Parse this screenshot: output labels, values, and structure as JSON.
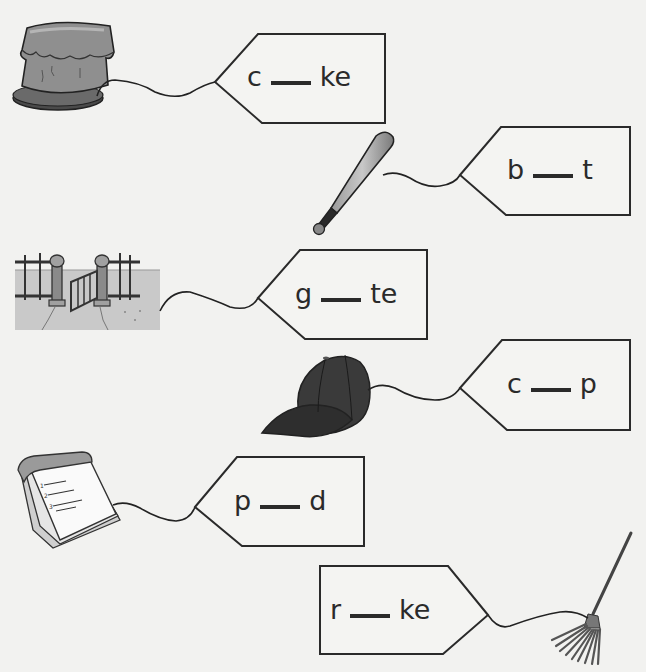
{
  "worksheet": {
    "items": [
      {
        "picture": "cake",
        "prefix": "c",
        "blank": "___",
        "suffix": "ke"
      },
      {
        "picture": "baseball-bat",
        "prefix": "b",
        "blank": "___",
        "suffix": "t"
      },
      {
        "picture": "gate",
        "prefix": "g",
        "blank": "___",
        "suffix": "te"
      },
      {
        "picture": "cap",
        "prefix": "c",
        "blank": "___",
        "suffix": "p"
      },
      {
        "picture": "notepad",
        "prefix": "p",
        "blank": "___",
        "suffix": "d"
      },
      {
        "picture": "rake",
        "prefix": "r",
        "blank": "___",
        "suffix": "ke"
      }
    ]
  },
  "colors": {
    "background": "#f2f2f0",
    "outline": "#2a2a2a",
    "ink": "#2a2a2a",
    "gray_fill": "#8e8e8e",
    "dark_fill": "#333333"
  }
}
